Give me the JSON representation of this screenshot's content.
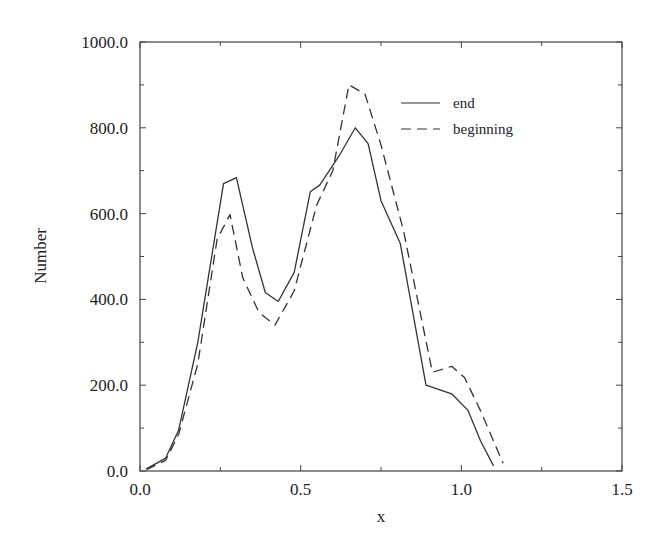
{
  "chart_data": {
    "type": "line",
    "title": "",
    "xlabel": "x",
    "ylabel": "Number",
    "xlim": [
      0.0,
      1.5
    ],
    "ylim": [
      0.0,
      1000.0
    ],
    "grid": false,
    "legend_position": "upper right (inside)",
    "x_ticks": [
      "0.0",
      "0.5",
      "1.0",
      "1.5"
    ],
    "y_ticks": [
      "0.0",
      "200.0",
      "400.0",
      "600.0",
      "800.0",
      "1000.0"
    ],
    "series": [
      {
        "name": "end",
        "style": "solid",
        "x": [
          0.02,
          0.08,
          0.12,
          0.18,
          0.26,
          0.3,
          0.35,
          0.39,
          0.43,
          0.48,
          0.53,
          0.56,
          0.62,
          0.67,
          0.71,
          0.75,
          0.81,
          0.89,
          0.97,
          1.02,
          1.06,
          1.1
        ],
        "y": [
          5,
          30,
          95,
          300,
          670,
          684,
          520,
          416,
          395,
          463,
          651,
          667,
          735,
          800,
          763,
          630,
          530,
          200,
          180,
          142,
          70,
          12
        ]
      },
      {
        "name": "beginning",
        "style": "dashed",
        "x": [
          0.02,
          0.08,
          0.12,
          0.18,
          0.24,
          0.28,
          0.32,
          0.37,
          0.42,
          0.48,
          0.55,
          0.6,
          0.65,
          0.7,
          0.75,
          0.82,
          0.91,
          0.97,
          1.01,
          1.06,
          1.13
        ],
        "y": [
          3,
          25,
          85,
          250,
          540,
          598,
          450,
          370,
          340,
          420,
          620,
          700,
          900,
          879,
          760,
          560,
          230,
          244,
          218,
          140,
          18
        ]
      }
    ]
  },
  "axes": {
    "x_label": "x",
    "y_label": "Number",
    "x_tick_labels": [
      "0.0",
      "0.5",
      "1.0",
      "1.5"
    ],
    "y_tick_labels": [
      "0.0",
      "200.0",
      "400.0",
      "600.0",
      "800.0",
      "1000.0"
    ]
  },
  "legend": {
    "items": [
      {
        "label": "end",
        "style": "solid"
      },
      {
        "label": "beginning",
        "style": "dashed"
      }
    ]
  },
  "colors": {
    "line": "#333333",
    "axis": "#444444",
    "background": "#ffffff"
  }
}
